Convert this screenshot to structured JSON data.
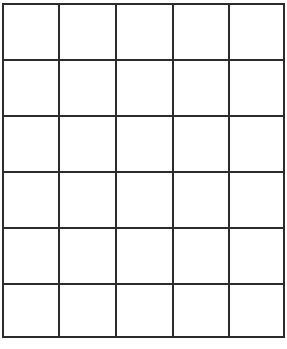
{
  "grid": {
    "columns": 5,
    "rows": 6,
    "line_color": "#2b2b2b",
    "background": "#ffffff",
    "cells": [
      [
        "",
        "",
        "",
        "",
        ""
      ],
      [
        "",
        "",
        "",
        "",
        ""
      ],
      [
        "",
        "",
        "",
        "",
        ""
      ],
      [
        "",
        "",
        "",
        "",
        ""
      ],
      [
        "",
        "",
        "",
        "",
        ""
      ],
      [
        "",
        "",
        "",
        "",
        ""
      ]
    ]
  }
}
